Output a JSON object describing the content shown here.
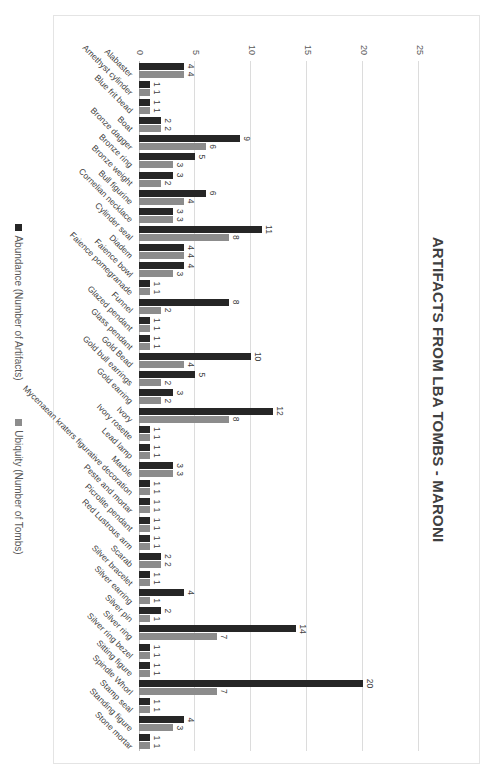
{
  "chart_data": {
    "type": "bar",
    "orientation_note": "chart is displayed rotated 90 degrees clockwise",
    "title": "ARTIFACTS FROM LBA TOMBS - MARONI",
    "xlabel": "",
    "ylabel": "",
    "ylim": [
      0,
      25
    ],
    "yticks": [
      0,
      5,
      10,
      15,
      20,
      25
    ],
    "grid": true,
    "legend_position": "bottom",
    "categories": [
      "Alabaster",
      "Amethyst cylinder",
      "Blue frit bead",
      "Boat",
      "Bronze dagger",
      "Bronze ring",
      "Bronze weight",
      "Bull figurine",
      "Cornelian necklace",
      "Cylinder seal",
      "Diadem",
      "Faience bowl",
      "Faience pomegranade",
      "Funnel",
      "Glazed pendant",
      "Glass pendant",
      "Gold Bead",
      "Gold bull earrings",
      "Gold earring",
      "Ivory",
      "Ivory rosette",
      "Lead lamp",
      "Marble",
      "Mycenaean kraters figurative decoration",
      "Peste and mortar",
      "Picrolite pendant",
      "Red Lustrous arm",
      "Scarab",
      "Silver bracelet",
      "Silver earring",
      "Silver pin",
      "Silver ring",
      "Silver ring bezel",
      "Sitting figure",
      "Spindle Whorl",
      "Stamp seal",
      "Standing figure",
      "Stone mortar"
    ],
    "series": [
      {
        "name": "Abundance (Number of Artifacts)",
        "color": "#262626",
        "values": [
          4,
          1,
          1,
          2,
          9,
          5,
          3,
          6,
          3,
          11,
          4,
          4,
          1,
          8,
          1,
          1,
          10,
          5,
          3,
          12,
          1,
          1,
          3,
          1,
          1,
          1,
          1,
          2,
          1,
          4,
          2,
          14,
          1,
          1,
          20,
          1,
          4,
          1
        ]
      },
      {
        "name": "Ubiquity (Number of Tombs)",
        "color": "#8c8c8c",
        "values": [
          4,
          1,
          1,
          2,
          6,
          3,
          2,
          4,
          3,
          8,
          4,
          3,
          1,
          2,
          1,
          1,
          4,
          2,
          2,
          8,
          1,
          1,
          3,
          1,
          1,
          1,
          1,
          2,
          1,
          1,
          1,
          7,
          1,
          1,
          7,
          1,
          3,
          1
        ]
      }
    ]
  },
  "legend": {
    "abundance_label": "Abundance (Number of Artifacts)",
    "ubiquity_label": "Ubiquity (Number of Tombs)"
  }
}
